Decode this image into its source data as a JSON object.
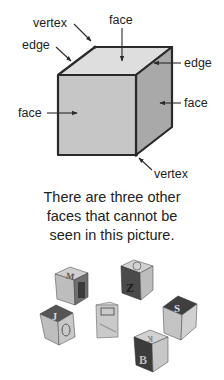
{
  "diagram": {
    "labels": {
      "vertex_top": "vertex",
      "face_top": "face",
      "edge_left": "edge",
      "edge_right": "edge",
      "face_right": "face",
      "face_left": "face",
      "vertex_bottom": "vertex"
    },
    "colors": {
      "front_face": "#c4c4c4",
      "top_face": "#dcdcdc",
      "side_face": "#a8a8a8",
      "edge": "#2a2a2a"
    }
  },
  "caption": {
    "lines": [
      "There are three other",
      "faces that cannot be",
      "seen in this picture."
    ]
  },
  "photo": {
    "description": "six wooden alphabet blocks",
    "block_letters": [
      "M",
      "Z",
      "J",
      "S",
      "B",
      "K"
    ]
  }
}
